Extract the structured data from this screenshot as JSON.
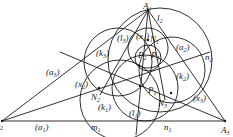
{
  "figure": {
    "type": "geometry-diagram",
    "vertices": [
      {
        "id": "A1",
        "main": "A",
        "sub": "1",
        "x": 148,
        "y": 10
      },
      {
        "id": "A2",
        "main": "",
        "sub": "2",
        "x": 2,
        "y": 121
      },
      {
        "id": "A3",
        "main": "A",
        "sub": "3",
        "x": 225,
        "y": 121
      }
    ],
    "labels": [
      {
        "id": "A1",
        "text": "A",
        "sub": "1",
        "x": 143,
        "y": 9
      },
      {
        "id": "l2",
        "text": "l",
        "sub": "2",
        "x": 157,
        "y": 21
      },
      {
        "id": "a2",
        "text": "(a",
        "sub": "2",
        "close": ")",
        "x": 176,
        "y": 50
      },
      {
        "id": "n2",
        "text": "n",
        "sub": "2",
        "x": 205,
        "y": 60
      },
      {
        "id": "k2",
        "text": "(k",
        "sub": "2",
        "close": ")",
        "x": 176,
        "y": 79
      },
      {
        "id": "x3",
        "text": "(x",
        "sub": "3",
        "close": ")",
        "x": 193,
        "y": 101
      },
      {
        "id": "A3",
        "text": "A",
        "sub": "3",
        "x": 221,
        "y": 133
      },
      {
        "id": "n1",
        "text": "n",
        "sub": "1",
        "x": 164,
        "y": 130
      },
      {
        "id": "l1",
        "text": "(l",
        "sub": "1",
        "close": ")",
        "x": 129,
        "y": 116
      },
      {
        "id": "N3",
        "text": "N",
        "sub": "3",
        "x": 158,
        "y": 106
      },
      {
        "id": "P1",
        "text": "P",
        "sub": "1",
        "x": 148,
        "y": 93
      },
      {
        "id": "N2",
        "text": "N",
        "sub": "2",
        "x": 91,
        "y": 100
      },
      {
        "id": "k1",
        "text": "(k",
        "sub": "1",
        "close": ")",
        "x": 98,
        "y": 110
      },
      {
        "id": "m1",
        "text": "m",
        "sub": "1",
        "x": 91,
        "y": 130
      },
      {
        "id": "a1",
        "text": "(a",
        "sub": "1",
        "close": ")",
        "x": 35,
        "y": 130
      },
      {
        "id": "x2",
        "text": "(x",
        "sub": "2",
        "close": ")",
        "x": 75,
        "y": 87
      },
      {
        "id": "a3",
        "text": "(a",
        "sub": "3",
        "close": ")",
        "x": 46,
        "y": 75
      },
      {
        "id": "k3",
        "text": "(k",
        "sub": "3",
        "close": ")",
        "x": 96,
        "y": 56
      },
      {
        "id": "l3",
        "text": "(l",
        "sub": "3",
        "close": ")",
        "x": 117,
        "y": 41
      },
      {
        "id": "x1",
        "text": "(x",
        "sub": "1",
        "close": ")",
        "x": 136,
        "y": 39
      },
      {
        "id": "N1",
        "text": "N",
        "sub": "1",
        "x": 150,
        "y": 42
      },
      {
        "id": "P2",
        "text": "P",
        "sub": "2",
        "x": 138,
        "y": 58
      },
      {
        "id": "P3",
        "text": "P",
        "sub": "3",
        "x": 151,
        "y": 58
      }
    ],
    "colors": {
      "stroke": "#1a1a1a",
      "background": "#ffffff"
    }
  }
}
